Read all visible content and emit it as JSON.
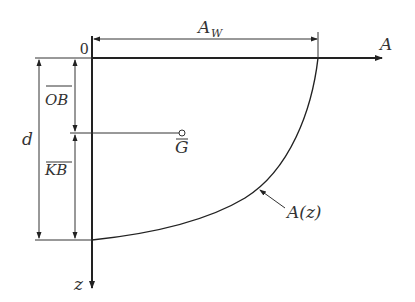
{
  "diagram": {
    "type": "waterplane-area curve",
    "colors": {
      "line": "#222222",
      "text": "#333333",
      "background": "#ffffff"
    },
    "labels": {
      "origin": "0",
      "a_axis": "A",
      "z_axis": "z",
      "aw": "A",
      "aw_sub": "W",
      "ob": "OB",
      "kb": "KB",
      "d": "d",
      "g": "G",
      "curve": "A(z)"
    }
  }
}
